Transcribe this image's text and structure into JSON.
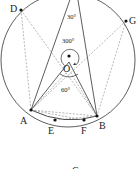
{
  "diagram": {
    "type": "circle-geometry",
    "circle": {
      "center_label": "O",
      "cx": 68,
      "cy": 60,
      "r": 67
    },
    "points": [
      {
        "label": "D",
        "x": 21,
        "y": 10,
        "lx": 10,
        "ly": 12
      },
      {
        "label": "G",
        "x": 126,
        "y": 21,
        "lx": 129,
        "ly": 24
      },
      {
        "label": "A",
        "x": 31,
        "y": 110,
        "lx": 20,
        "ly": 124
      },
      {
        "label": "B",
        "x": 97,
        "y": 116,
        "lx": 99,
        "ly": 129
      },
      {
        "label": "E",
        "x": 55,
        "y": 120,
        "lx": 48,
        "ly": 134
      },
      {
        "label": "F",
        "x": 84,
        "y": 120,
        "lx": 81,
        "ly": 134
      },
      {
        "label": "O",
        "x": 69,
        "y": 56,
        "lx": 62,
        "ly": 72
      }
    ],
    "angles": [
      {
        "label": "30°",
        "x": 67,
        "y": 19
      },
      {
        "label": "300°",
        "x": 62,
        "y": 43
      },
      {
        "label": "60°",
        "x": 61,
        "y": 92
      }
    ],
    "bottom_label": {
      "label": "C",
      "x": 73,
      "y": 173
    }
  }
}
